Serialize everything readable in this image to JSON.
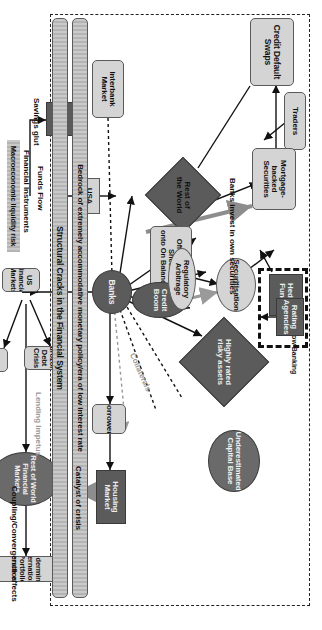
{
  "figure": {
    "type": "flowchart",
    "orientation": "rotated-90-clockwise"
  },
  "groups": {
    "outer_dashed": "outer-dashed-boundary",
    "shadow_banking": "Shadow Banking"
  },
  "nodes": {
    "traders": "Traders",
    "hedge_funds": "Hedge Funds",
    "shadow_banking": "Shadow Banking",
    "rating_agencies": "Rating\nAgencies",
    "credit_default_swaps": "Credit Default Swaps",
    "mortgage_backed": "Mortgage-backed\nSecurities",
    "securitisation": "Securitisation",
    "highly_rated": "Highly rated\nrisky assets",
    "underestimated_capital": "Underestimated\nCapital Base",
    "rest_of_world": "Rest of\nthe World",
    "off_balance": "Off Balance Sheet\nonto On Balance",
    "credit_boom": "Credit Boom",
    "regulatory_arbitrage": "Regulatory Arbitrage",
    "housing_market": "Housing Market",
    "interbank_market": "Interbank\nMarket",
    "usa": "USA",
    "banks": "Banks",
    "borrowers": "Borrowers",
    "china": "China",
    "us_financial_markets": "US Financial Markets",
    "eurozone_debt_crisis": "Eurozone Debt Crisis",
    "international_trade": "International Trade",
    "row_financial_markets": "Rest of World Financial Markets",
    "undermined_diversification": "Undermined International Portfolio Diversification"
  },
  "bars": {
    "bedrock": "Bedrock of extremely accommodative monetary policy/era of low interest rate",
    "structural_cracks": "Structural Cracks in the Financial System"
  },
  "edge_labels": {
    "banks_invest": "Banks invest in own securities",
    "collaterals": "Collaterals",
    "catalyst": "Catalyst of crisis",
    "financial_instruments": "Financial Instruments",
    "macro_liquidity": "Macroeconomic liquidity risk",
    "funds_flow": "Funds Flow",
    "savings_glut": "Savings glut",
    "lending_impetus": "Lending Impetus",
    "coupling": "Coupling/Convergence effects"
  },
  "colors": {
    "light_fill": "#d4d4d4",
    "dark_fill": "#5b5b5b",
    "mid_fill": "#6a6a6a",
    "stroke": "#3a3a3a",
    "grey_text": "#9a9a9a",
    "background": "#ffffff"
  }
}
